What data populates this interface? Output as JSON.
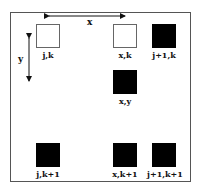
{
  "diagram": {
    "axes": {
      "x_label": "x",
      "y_label": "y"
    },
    "cells": [
      {
        "id": "jk",
        "label": "j,k",
        "fill": "white",
        "x": 36,
        "y": 24
      },
      {
        "id": "xk",
        "label": "x,k",
        "fill": "white",
        "x": 113,
        "y": 24
      },
      {
        "id": "j1k",
        "label": "j+1,k",
        "fill": "black",
        "x": 152,
        "y": 24
      },
      {
        "id": "xy",
        "label": "x,y",
        "fill": "black",
        "x": 113,
        "y": 70
      },
      {
        "id": "jk1",
        "label": "j,k+1",
        "fill": "black",
        "x": 36,
        "y": 143
      },
      {
        "id": "xk1",
        "label": "x,k+1",
        "fill": "black",
        "x": 113,
        "y": 143
      },
      {
        "id": "j1k1",
        "label": "j+1,k+1",
        "fill": "black",
        "x": 152,
        "y": 143
      }
    ],
    "colors": {
      "filled": "#000000",
      "empty": "#ffffff",
      "border": "#555555"
    }
  }
}
